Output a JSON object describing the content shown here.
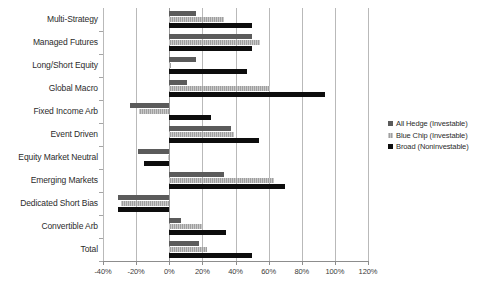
{
  "chart_data": {
    "type": "bar",
    "orientation": "horizontal",
    "title": "",
    "xlabel": "",
    "ylabel": "",
    "xlim": [
      -40,
      120
    ],
    "xticks": [
      -40,
      -20,
      0,
      20,
      40,
      60,
      80,
      100,
      120
    ],
    "xtick_labels": [
      "-40%",
      "-20%",
      "0%",
      "20%",
      "40%",
      "60%",
      "80%",
      "100%",
      "120%"
    ],
    "grid": true,
    "grid_axis": "x",
    "legend_position": "right",
    "categories": [
      "Multi-Strategy",
      "Managed Futures",
      "Long/Short Equity",
      "Global Macro",
      "Fixed Income Arb",
      "Event Driven",
      "Equity Market Neutral",
      "Emerging Markets",
      "Dedicated Short Bias",
      "Convertible Arb",
      "Total"
    ],
    "series": [
      {
        "name": "All Hedge (Investable)",
        "color": "#5b5b5b",
        "values": [
          16,
          50,
          16,
          11,
          -24,
          37,
          -19,
          33,
          -31,
          7,
          18
        ]
      },
      {
        "name": "Blue Chip (Investable)",
        "color": "#b3b3b3",
        "values": [
          33,
          55,
          1,
          61,
          -18,
          39,
          -1,
          63,
          -29,
          20,
          23
        ]
      },
      {
        "name": "Broad (Noninvestable)",
        "color": "#0d0d0d",
        "values": [
          50,
          50,
          47,
          94,
          25,
          54,
          -15,
          70,
          -31,
          34,
          50
        ]
      }
    ]
  },
  "legend": {
    "entries": [
      {
        "label": "All Hedge (Investable)"
      },
      {
        "label": "Blue Chip (Investable)"
      },
      {
        "label": "Broad (Noninvestable)"
      }
    ]
  }
}
